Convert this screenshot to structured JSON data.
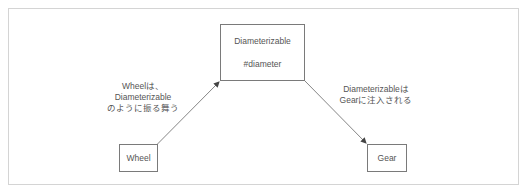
{
  "diagram": {
    "nodes": {
      "interface": {
        "title": "Diameterizable",
        "method": "#diameter"
      },
      "wheel": {
        "label": "Wheel"
      },
      "gear": {
        "label": "Gear"
      }
    },
    "edges": {
      "wheel_to_interface": {
        "line1": "Wheelは、",
        "line2": "Diameterizable",
        "line3": "のように振る舞う"
      },
      "interface_to_gear": {
        "line1": "Diameterizableは",
        "line2": "Gearに注入される"
      }
    },
    "colors": {
      "frame_border": "#d4d4d4",
      "box_border": "#7a7a7a",
      "text": "#555555",
      "arrow": "#555555"
    }
  }
}
